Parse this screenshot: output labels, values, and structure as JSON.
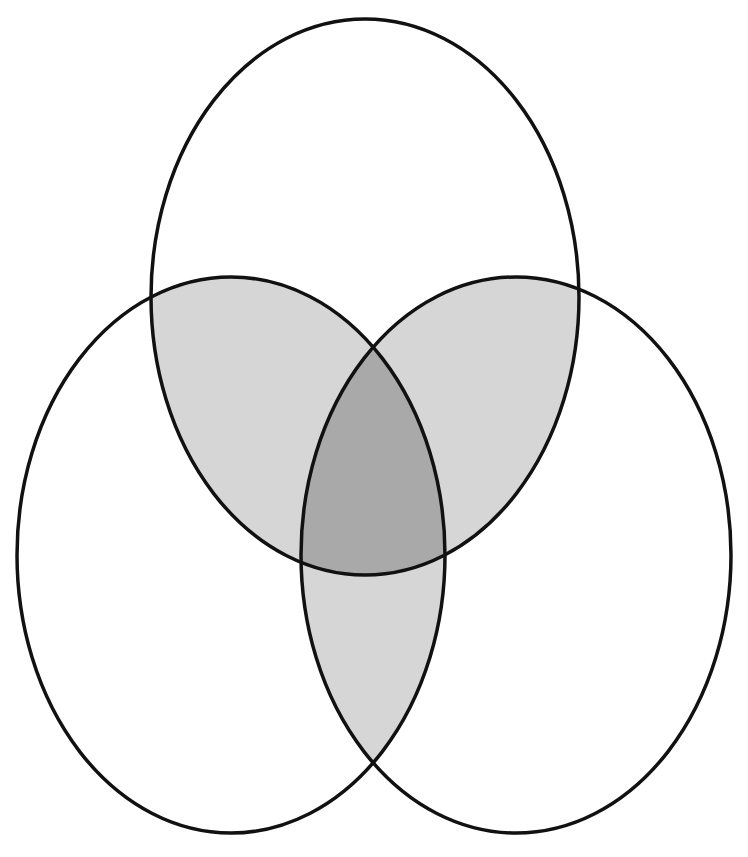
{
  "diagram": {
    "type": "venn",
    "set_count": 3,
    "sets": [
      {
        "id": "top",
        "label": "",
        "shape": "ellipse",
        "cx": 365,
        "cy": 297,
        "rx": 214,
        "ry": 278
      },
      {
        "id": "left",
        "label": "",
        "shape": "ellipse",
        "cx": 231,
        "cy": 555,
        "rx": 214,
        "ry": 278
      },
      {
        "id": "right",
        "label": "",
        "shape": "ellipse",
        "cx": 516,
        "cy": 555,
        "rx": 215,
        "ry": 278
      }
    ],
    "shaded_regions": [
      {
        "region": "top∩left only",
        "shade": "light"
      },
      {
        "region": "top∩right only",
        "shade": "light"
      },
      {
        "region": "left∩right only",
        "shade": "light"
      },
      {
        "region": "top∩left∩right",
        "shade": "dark"
      }
    ],
    "unshaded_regions": [
      "top only",
      "left only",
      "right only"
    ],
    "colors": {
      "background": "#ffffff",
      "stroke": "#111111",
      "pairwise_overlap_fill": "#d6d6d6",
      "triple_overlap_fill": "#a9a9a9"
    },
    "stroke_width": 3.5
  }
}
